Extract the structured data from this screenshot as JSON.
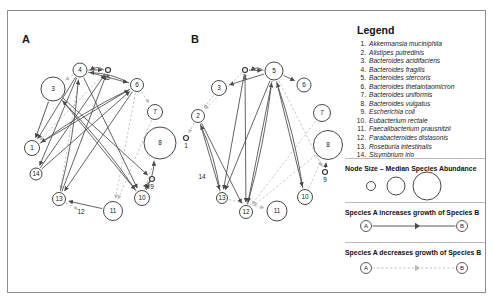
{
  "figure": {
    "panels": [
      {
        "id": "A",
        "label": "A"
      },
      {
        "id": "B",
        "label": "B"
      }
    ]
  },
  "legend": {
    "title": "Legend",
    "species": [
      {
        "num": "1.",
        "name": "Akkermansia muciniphila"
      },
      {
        "num": "2.",
        "name": "Alistipes putredinis"
      },
      {
        "num": "3.",
        "name": "Bacteroides acidifaciens"
      },
      {
        "num": "4.",
        "name": "Bacteroides fragilis"
      },
      {
        "num": "5.",
        "name": "Bacteroides stercoris"
      },
      {
        "num": "6.",
        "name": "Bacteroides thetaiotaomicron"
      },
      {
        "num": "7.",
        "name": "Bacteroides uniformis"
      },
      {
        "num": "8.",
        "name": "Bacteroides vulgatus"
      },
      {
        "num": "9.",
        "name": "Escherichia coli"
      },
      {
        "num": "10.",
        "name": "Eubacterium rectale"
      },
      {
        "num": "11.",
        "name": "Faecalibacterium prausnitzii"
      },
      {
        "num": "12.",
        "name": "Parabacteroides distasonis"
      },
      {
        "num": "13.",
        "name": "Roseburia intestinalis"
      },
      {
        "num": "14.",
        "name": "Sisymbrium irio"
      }
    ],
    "node_size_caption": "Node Size – Median Species Abundance",
    "node_size_samples": [
      {
        "label": "small",
        "r": 4.5
      },
      {
        "label": "medium",
        "r": 9.0
      },
      {
        "label": "large",
        "r": 14.0
      }
    ],
    "increase_caption": "Species A increases growth of Species B",
    "decrease_caption": "Species A decreases growth of Species B",
    "edge_endpoint_labels": {
      "source": "A",
      "target": "B"
    }
  },
  "style": {
    "positive_edge_color": "#4a4a4a",
    "negative_edge_color": "#b9b9b9",
    "node_stroke": "#333333",
    "node_fill": "#ffffff",
    "text_color": "#1a1a1a",
    "frame_color": "#8d8d8d"
  },
  "chart_data": {
    "type": "diagram",
    "subtype": "directed-network",
    "node_size_meaning": "Median species abundance",
    "edge_meaning": {
      "solid_dark_arrow": "Species A increases growth of Species B",
      "dashed_light_arrow": "Species A decreases growth of Species B"
    },
    "panels": [
      {
        "id": "A",
        "nodes": [
          {
            "id": 1,
            "x": 32,
            "y": 148,
            "r": 7.5
          },
          {
            "id": 3,
            "x": 53,
            "y": 89,
            "r": 12.0
          },
          {
            "id": 4,
            "x": 80,
            "y": 70,
            "r": 7.0
          },
          {
            "id": 5,
            "x": 108,
            "y": 70,
            "r": 2.5
          },
          {
            "id": 6,
            "x": 137,
            "y": 85,
            "r": 6.5
          },
          {
            "id": 7,
            "x": 155,
            "y": 112,
            "r": 7.5
          },
          {
            "id": 8,
            "x": 160,
            "y": 143,
            "r": 16.0
          },
          {
            "id": 9,
            "x": 152,
            "y": 179,
            "r": 2.5
          },
          {
            "id": 10,
            "x": 142,
            "y": 198,
            "r": 7.5
          },
          {
            "id": 11,
            "x": 113,
            "y": 211,
            "r": 9.5
          },
          {
            "id": 12,
            "x": 81,
            "y": 211,
            "r": 0.0
          },
          {
            "id": 13,
            "x": 59,
            "y": 199,
            "r": 6.5
          },
          {
            "id": 14,
            "x": 36,
            "y": 174,
            "r": 6.0
          }
        ],
        "positive_edges": [
          [
            4,
            5
          ],
          [
            5,
            4
          ],
          [
            4,
            6
          ],
          [
            6,
            4
          ],
          [
            4,
            1
          ],
          [
            4,
            14
          ],
          [
            4,
            10
          ],
          [
            3,
            1
          ],
          [
            3,
            9
          ],
          [
            3,
            10
          ],
          [
            1,
            6
          ],
          [
            14,
            6
          ],
          [
            14,
            5
          ],
          [
            13,
            5
          ],
          [
            13,
            4
          ],
          [
            11,
            13
          ],
          [
            10,
            9
          ],
          [
            10,
            8
          ],
          [
            10,
            3
          ],
          [
            6,
            13
          ],
          [
            6,
            1
          ],
          [
            9,
            10
          ]
        ],
        "negative_edges": [
          [
            4,
            3
          ],
          [
            4,
            13
          ],
          [
            6,
            7
          ],
          [
            6,
            11
          ],
          [
            3,
            1
          ],
          [
            5,
            1
          ],
          [
            8,
            10
          ],
          [
            13,
            12
          ],
          [
            7,
            11
          ]
        ]
      },
      {
        "id": "B",
        "nodes": [
          {
            "id": 2,
            "x": 198,
            "y": 116,
            "r": 6.5
          },
          {
            "id": 3,
            "x": 219,
            "y": 88,
            "r": 7.5
          },
          {
            "id": 4,
            "x": 245,
            "y": 70,
            "r": 2.5
          },
          {
            "id": 5,
            "x": 274,
            "y": 71,
            "r": 9.0
          },
          {
            "id": 6,
            "x": 304,
            "y": 85,
            "r": 7.0
          },
          {
            "id": 7,
            "x": 322,
            "y": 113,
            "r": 8.5
          },
          {
            "id": 8,
            "x": 328,
            "y": 145,
            "r": 14.5
          },
          {
            "id": 9,
            "x": 325,
            "y": 172,
            "r": 2.5
          },
          {
            "id": 10,
            "x": 305,
            "y": 197,
            "r": 7.5
          },
          {
            "id": 11,
            "x": 277,
            "y": 211,
            "r": 10.0
          },
          {
            "id": 12,
            "x": 246,
            "y": 212,
            "r": 6.5
          },
          {
            "id": 13,
            "x": 222,
            "y": 198,
            "r": 5.5
          },
          {
            "id": 14,
            "x": 202,
            "y": 176,
            "r": 0.0
          },
          {
            "id": 1,
            "x": 186,
            "y": 138,
            "r": 2.5
          }
        ],
        "positive_edges": [
          [
            4,
            5
          ],
          [
            5,
            4
          ],
          [
            5,
            6
          ],
          [
            5,
            3
          ],
          [
            5,
            13
          ],
          [
            5,
            12
          ],
          [
            5,
            10
          ],
          [
            4,
            13
          ],
          [
            4,
            12
          ],
          [
            2,
            12
          ],
          [
            2,
            13
          ],
          [
            12,
            5
          ],
          [
            13,
            2
          ],
          [
            10,
            5
          ],
          [
            9,
            8
          ]
        ],
        "negative_edges": [
          [
            3,
            2
          ],
          [
            4,
            2
          ],
          [
            2,
            1
          ],
          [
            5,
            9
          ],
          [
            8,
            12
          ],
          [
            7,
            12
          ],
          [
            13,
            11
          ],
          [
            10,
            8
          ]
        ]
      }
    ]
  }
}
